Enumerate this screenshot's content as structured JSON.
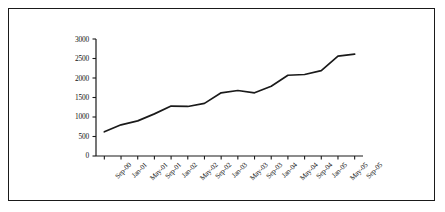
{
  "chart_data": {
    "type": "line",
    "title": "",
    "subtitle": "",
    "xlabel": "",
    "ylabel": "",
    "grid": false,
    "legend": false,
    "legend_position": "none",
    "line_color": "#1a1a1a",
    "categories": [
      "Sep-00",
      "Jan-01",
      "May-01",
      "Sep-01",
      "Jan-02",
      "May-02",
      "Sep-02",
      "Jan-03",
      "May-03",
      "Sep-03",
      "Jan-04",
      "May-04",
      "Sep-04",
      "Jan-05",
      "May-05",
      "Sep-05"
    ],
    "values": [
      620,
      800,
      900,
      1080,
      1280,
      1270,
      1350,
      1620,
      1680,
      1620,
      1790,
      2070,
      2090,
      2190,
      2560,
      2610
    ],
    "ylim": [
      0,
      3000
    ],
    "yticks": [
      0,
      500,
      1000,
      1500,
      2000,
      2500,
      3000
    ],
    "ytick_labels": [
      "0",
      "500",
      "1000",
      "1500",
      "2000",
      "2500",
      "3000"
    ],
    "series": [
      {
        "name": "series-1",
        "values": [
          620,
          800,
          900,
          1080,
          1280,
          1270,
          1350,
          1620,
          1680,
          1620,
          1790,
          2070,
          2090,
          2190,
          2560,
          2610
        ]
      }
    ]
  },
  "figure": {
    "border_color": "#1a1a1a",
    "background_color": "#ffffff"
  }
}
